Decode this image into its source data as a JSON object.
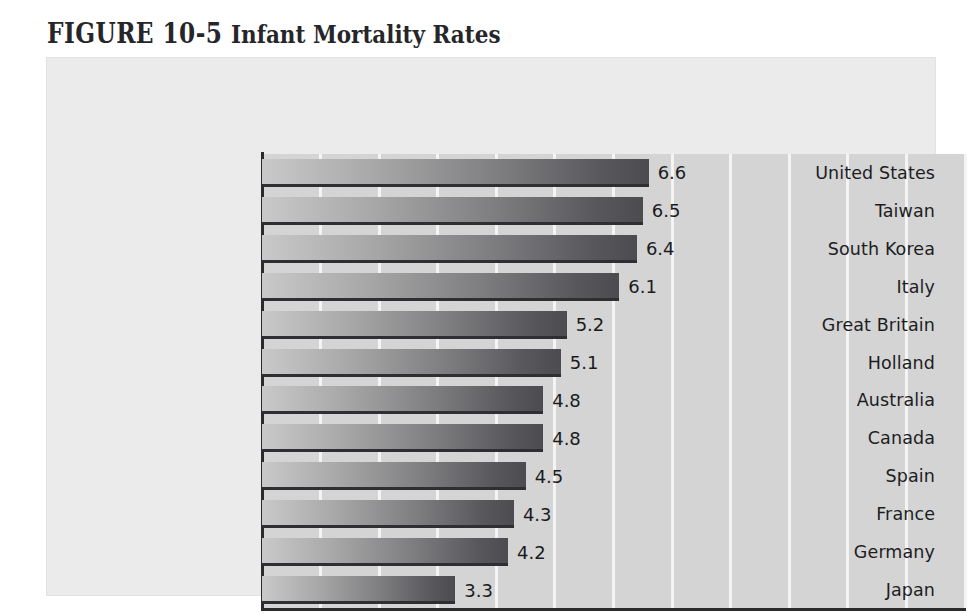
{
  "title": {
    "figure_label": "FIGURE 10-5",
    "figure_name": "Infant Mortality Rates"
  },
  "colors": {
    "page_background": "#ffffff",
    "panel_background": "#ebebeb",
    "plot_background": "#d4d4d4",
    "gridline": "#f4f4f4",
    "axis_line": "#2b2b2b",
    "bar_light": "#c9c9c9",
    "bar_dark": "#4c4c50",
    "bar_edge": "#2f2f33",
    "text": "#1b1b1d"
  },
  "chart_data": {
    "type": "bar",
    "orientation": "horizontal",
    "title": "FIGURE 10-5  Infant Mortality Rates",
    "xlabel": "",
    "ylabel": "",
    "xlim": [
      0,
      12
    ],
    "xticks": [
      "0",
      "1",
      "2",
      "3",
      "4",
      "5",
      "6",
      "7",
      "8",
      "9",
      "10",
      "11",
      "12"
    ],
    "xtick_step": 1,
    "grid": "vertical",
    "legend": "none",
    "categories": [
      "United States",
      "Taiwan",
      "South Korea",
      "Italy",
      "Great Britain",
      "Holland",
      "Australia",
      "Canada",
      "Spain",
      "France",
      "Germany",
      "Japan"
    ],
    "values": [
      6.6,
      6.5,
      6.4,
      6.1,
      5.2,
      5.1,
      4.8,
      4.8,
      4.5,
      4.3,
      4.2,
      3.3
    ],
    "value_labels": [
      "6.6",
      "6.5",
      "6.4",
      "6.1",
      "5.2",
      "5.1",
      "4.8",
      "4.8",
      "4.5",
      "4.3",
      "4.2",
      "3.3"
    ]
  }
}
